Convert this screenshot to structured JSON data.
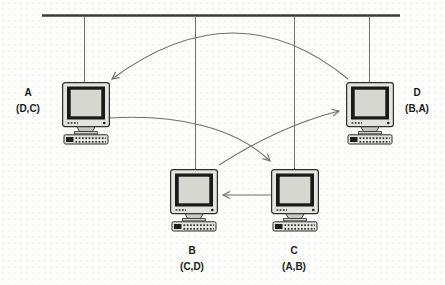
{
  "figure": {
    "type": "bus-network-diagram",
    "colors": {
      "background": "#fcfcfa",
      "bus": "#3a3a3a",
      "lines": "#6f6f6f",
      "monitor_case": "#e4e4de",
      "monitor_bezel": "#191919",
      "monitor_screen": "#d7d7d1",
      "text": "#1b1b1b"
    },
    "nodes": [
      {
        "id": "A",
        "label": "A",
        "sublabel": "(D,C)",
        "label_side": "left"
      },
      {
        "id": "B",
        "label": "B",
        "sublabel": "(C,D)",
        "label_side": "below"
      },
      {
        "id": "C",
        "label": "C",
        "sublabel": "(A,B)",
        "label_side": "below"
      },
      {
        "id": "D",
        "label": "D",
        "sublabel": "(B,A)",
        "label_side": "right"
      }
    ],
    "arrows": [
      {
        "from": "D",
        "to": "A"
      },
      {
        "from": "A",
        "to": "C"
      },
      {
        "from": "B",
        "to": "D"
      },
      {
        "from": "C",
        "to": "B"
      }
    ]
  }
}
